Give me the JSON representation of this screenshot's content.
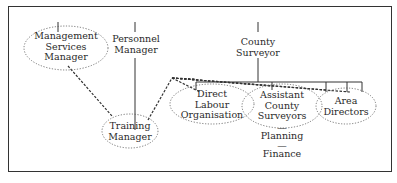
{
  "diagram": {
    "nodes": {
      "management_services_manager": {
        "line1": "Management",
        "line2": "Services",
        "line3": "Manager"
      },
      "personnel_manager": {
        "line1": "Personnel",
        "line2": "Manager"
      },
      "county_surveyor": {
        "line1": "County",
        "line2": "Surveyor"
      },
      "direct_labour_organisation": {
        "line1": "Direct",
        "line2": "Labour",
        "line3": "Organisation"
      },
      "assistant_county_surveyors": {
        "line1": "Assistant",
        "line2": "County",
        "line3": "Surveyors"
      },
      "planning": {
        "dash": "—",
        "label": "Planning"
      },
      "finance": {
        "dash": "—",
        "label": "Finance"
      },
      "area_directors": {
        "line1": "Area",
        "line2": "Directors"
      },
      "training_manager": {
        "line1": "Training",
        "line2": "Manager"
      }
    },
    "colors": {
      "line": "#333333",
      "border": "#333333",
      "text": "#2a2a2a"
    }
  }
}
